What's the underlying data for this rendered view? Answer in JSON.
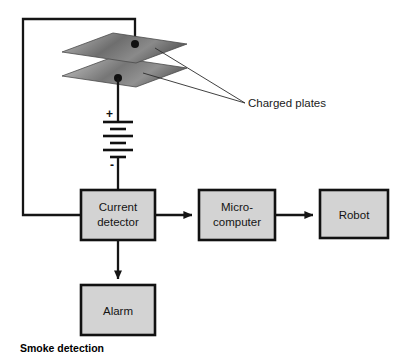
{
  "figure": {
    "caption": "Smoke detection",
    "background_color": "#ffffff"
  },
  "annotations": [
    {
      "id": "charged-plates",
      "text": "Charged plates",
      "x": 248,
      "y": 107
    }
  ],
  "plates": {
    "label": "Charged plates",
    "count": 2,
    "fill_light": "#d8d8d8",
    "fill_dark": "#5d5d5d",
    "edge_color": "#4a4a4a",
    "upper": {
      "name": "upper-charged-plate",
      "points": "62,52 113,33 187,44 136,63"
    },
    "lower": {
      "name": "lower-charged-plate",
      "points": "62,76 113,57 187,68 136,87"
    }
  },
  "battery": {
    "name": "battery-symbol",
    "positive_sign": "+",
    "negative_sign": "-",
    "plus_x": 109,
    "plus_y": 114,
    "minus_x": 111,
    "minus_y": 164,
    "cells": 4,
    "long_half_width": 15,
    "short_half_width": 8,
    "center_x": 118,
    "plate_y_positions": [
      122,
      129,
      136,
      143,
      150,
      157
    ]
  },
  "boxes": [
    {
      "id": "current-detector",
      "name": "current-detector-box",
      "label_lines": [
        "Current",
        "detector"
      ],
      "x": 81,
      "y": 190,
      "width": 74,
      "height": 50,
      "fill": "#d3d3d3",
      "stroke": "#111111"
    },
    {
      "id": "micro-computer",
      "name": "micro-computer-box",
      "label_lines": [
        "Micro-",
        "computer"
      ],
      "x": 199,
      "y": 190,
      "width": 76,
      "height": 50,
      "fill": "#d3d3d3",
      "stroke": "#111111"
    },
    {
      "id": "robot",
      "name": "robot-box",
      "label_lines": [
        "Robot"
      ],
      "x": 320,
      "y": 190,
      "width": 68,
      "height": 48,
      "fill": "#d3d3d3",
      "stroke": "#111111"
    },
    {
      "id": "alarm",
      "name": "alarm-box",
      "label_lines": [
        "Alarm"
      ],
      "x": 81,
      "y": 285,
      "width": 74,
      "height": 50,
      "fill": "#d3d3d3",
      "stroke": "#111111"
    }
  ],
  "wires": {
    "return_loop": "M 135,44 L 135,19 L 23,19 L 23,215 L 81,215",
    "lower_plate_to_battery": "M 118,78 L 118,122",
    "battery_to_detector": "M 118,157 L 118,190",
    "detector_to_microcomputer": "M 155,215 L 192,215",
    "microcomputer_to_robot": "M 275,215 L 313,215",
    "detector_to_alarm": "M 118,240 L 118,279"
  },
  "nodes": [
    {
      "name": "upper-plate-terminal-dot",
      "x": 135,
      "y": 44,
      "r": 4
    },
    {
      "name": "lower-plate-terminal-dot",
      "x": 118,
      "y": 78,
      "r": 4
    }
  ],
  "leader_lines": {
    "converge_x": 245,
    "converge_y": 103,
    "to_upper_plate": "M 245,103 L 155,48",
    "to_lower_plate": "M 245,103 L 143,73"
  }
}
